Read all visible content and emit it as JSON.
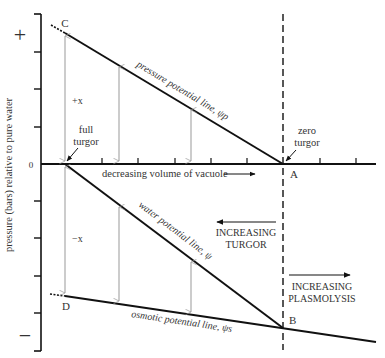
{
  "diagram": {
    "y_axis": {
      "label": "pressure (bars) relative to pure water",
      "plus_label": "+",
      "minus_label": "−",
      "zero_label": "0"
    },
    "points": {
      "A": "A",
      "B": "B",
      "C": "C",
      "D": "D"
    },
    "labels": {
      "full_turgor_line1": "full",
      "full_turgor_line2": "turgor",
      "zero_turgor_line1": "zero",
      "zero_turgor_line2": "turgor",
      "plus_x": "+x",
      "minus_x": "−x",
      "decreasing_volume": "decreasing volume of vacuole",
      "pressure_potential": "pressure potential line, ψp",
      "water_potential": "water potential line, ψ",
      "osmotic_potential": "osmotic potential line, ψs",
      "increasing_turgor_line1": "INCREASING",
      "increasing_turgor_line2": "TURGOR",
      "increasing_plasmolysis_line1": "INCREASING",
      "increasing_plasmolysis_line2": "PLASMOLYSIS"
    },
    "colors": {
      "line": "#111111",
      "thin_arrow": "#999999",
      "text": "#333333"
    }
  }
}
